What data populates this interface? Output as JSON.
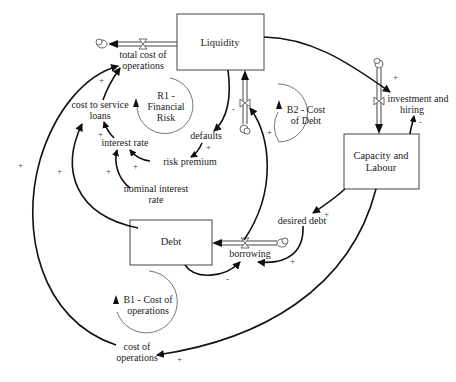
{
  "diagram": {
    "type": "causal-loop / stock-and-flow diagram",
    "stocks": [
      {
        "id": "liquidity",
        "label": "Liquidity"
      },
      {
        "id": "capacity",
        "label_lines": [
          "Capacity and",
          "Labour"
        ]
      },
      {
        "id": "debt",
        "label": "Debt"
      }
    ],
    "flows": [
      {
        "id": "total_cost_flow",
        "label_lines": [
          "total cost of",
          "operations"
        ]
      },
      {
        "id": "investment_flow",
        "label_lines": [
          "investment  and",
          "hiring"
        ]
      },
      {
        "id": "borrowing_flow",
        "label": "borrowing"
      },
      {
        "id": "liquidity_inflow",
        "label": ""
      }
    ],
    "variables": {
      "cost_to_service": [
        "cost to service",
        "loans"
      ],
      "interest_rate": "interest rate",
      "risk_premium": "risk premium",
      "nominal_interest": [
        "nominal interest",
        "rate"
      ],
      "defaults": "defaults",
      "desired_debt": "desired debt",
      "cost_of_operations": [
        "cost of",
        "operations"
      ]
    },
    "loops": {
      "r1": [
        "R1 -",
        "Financial",
        "Risk"
      ],
      "b2": [
        "B2 - Cost",
        "of Debt"
      ],
      "b1": [
        "B1 - Cost of",
        "operations"
      ]
    },
    "signs": {
      "plus": "+",
      "minus": "-"
    }
  }
}
